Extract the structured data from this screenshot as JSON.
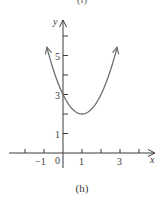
{
  "captions": {
    "top": "(i)",
    "bottom": "(h)"
  },
  "colors": {
    "axis": "#3a3a3a",
    "curve": "#6e6e6e",
    "text": "#3a3a3a"
  },
  "chart_data": {
    "type": "line",
    "title": "",
    "caption": "(h)",
    "xlabel": "x",
    "ylabel": "y",
    "function": "y = (x - 1)^2 + 2",
    "vertex": [
      1,
      2
    ],
    "y_intercept": 3,
    "x_ticks": [
      -2,
      -1,
      0,
      1,
      2,
      3,
      4
    ],
    "x_tick_labels": [
      "-1",
      "0",
      "1",
      "3"
    ],
    "y_ticks": [
      1,
      2,
      3,
      4,
      5,
      6
    ],
    "y_tick_labels": [
      "1",
      "3",
      "5"
    ],
    "xlim": [
      -3,
      4.8
    ],
    "ylim": [
      -0.8,
      7
    ],
    "grid": false,
    "legend": null,
    "series": [
      {
        "name": "parabola",
        "x": [
          -0.8,
          -0.5,
          0,
          0.5,
          1,
          1.5,
          2,
          2.5,
          2.8
        ],
        "y": [
          5.24,
          4.25,
          3,
          2.25,
          2,
          2.25,
          3,
          4.25,
          5.24
        ]
      }
    ],
    "arrows": {
      "curve_both_ends": true,
      "x_axis_positive": true,
      "y_axis_positive": true
    }
  }
}
